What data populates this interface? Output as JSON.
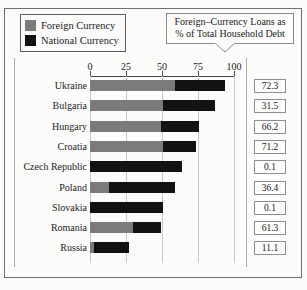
{
  "legend": {
    "items": [
      {
        "label": "Foreign Currency",
        "color": "#7b7b7b",
        "swatch_name": "legend-swatch-foreign"
      },
      {
        "label": "National Currency",
        "color": "#121212",
        "swatch_name": "legend-swatch-national"
      }
    ]
  },
  "callout": {
    "line1": "Foreign–Currency Loans as",
    "line2": "% of Total Household Debt"
  },
  "chart_data": {
    "type": "bar",
    "orientation": "horizontal",
    "stacked": true,
    "title": "",
    "subtitle": "",
    "xlabel": "",
    "ylabel": "",
    "xlim": [
      0,
      100
    ],
    "xticks": [
      0,
      25,
      50,
      75,
      100
    ],
    "xtick_labels": [
      "0",
      "25",
      "50",
      "75",
      "100"
    ],
    "grid": true,
    "grid_axis": "x",
    "legend_position": "top-left",
    "categories": [
      "Ukraine",
      "Bulgaria",
      "Hungary",
      "Croatia",
      "Czech Republic",
      "Poland",
      "Slovakia",
      "Romania",
      "Russia"
    ],
    "series": [
      {
        "name": "Foreign Currency",
        "color": "#7b7b7b",
        "values": [
          59.0,
          51.0,
          49.0,
          50.5,
          0.1,
          13.5,
          0.1,
          30.0,
          3.0
        ]
      },
      {
        "name": "National Currency",
        "color": "#121212",
        "values": [
          35.0,
          36.0,
          27.0,
          23.0,
          63.9,
          45.5,
          50.9,
          19.0,
          24.0
        ]
      }
    ],
    "annotations": {
      "label": "Foreign-Currency Loans as % of Total Household Debt",
      "values": [
        72.3,
        31.5,
        66.2,
        71.2,
        0.1,
        36.4,
        0.1,
        61.3,
        11.1
      ],
      "value_strings": [
        "72.3",
        "31.5",
        "66.2",
        "71.2",
        "0.1",
        "36.4",
        "0.1",
        "61.3",
        "11.1"
      ]
    }
  }
}
